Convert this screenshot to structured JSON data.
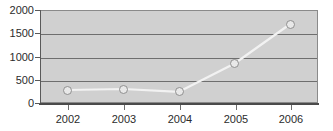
{
  "chart_data": {
    "type": "line",
    "title": "",
    "subtitle": "",
    "xlabel": "",
    "ylabel": "",
    "categories": [
      "2002",
      "2003",
      "2004",
      "2005",
      "2006"
    ],
    "values": [
      280,
      300,
      240,
      850,
      1700
    ],
    "series": [
      {
        "name": "",
        "values": [
          280,
          300,
          240,
          850,
          1700
        ]
      }
    ],
    "ylim": [
      0,
      2000
    ],
    "yticks": [
      0,
      500,
      1000,
      1500,
      2000
    ],
    "ytick_labels": [
      "0",
      "500",
      "1000",
      "1500",
      "2000"
    ],
    "xtick_labels": [
      "2002",
      "2003",
      "2004",
      "2005",
      "2006"
    ],
    "grid": true,
    "grid_axis": "y",
    "legend": false,
    "legend_position": "none",
    "marker": "circle-open",
    "colors": {
      "plot_background": "#d0d0d0",
      "figure_background": "#ffffff",
      "gridline": "#6e6e6e",
      "axis": "#595959",
      "line": "#f2f2f2",
      "marker_fill": "#e8e8e8",
      "marker_edge": "#8f8f8f",
      "tick_label": "#2b2b2b"
    }
  }
}
